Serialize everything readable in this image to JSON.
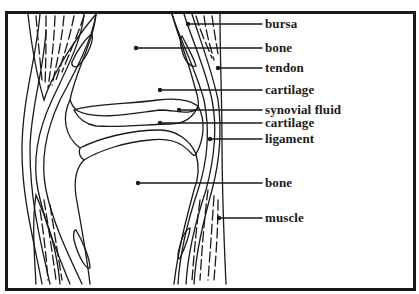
{
  "diagram": {
    "colors": {
      "stroke": "#1a1a1a",
      "background": "#ffffff"
    },
    "labels": [
      {
        "id": "bursa",
        "text": "bursa",
        "x": 265,
        "y": 18
      },
      {
        "id": "bone-upper",
        "text": "bone",
        "x": 265,
        "y": 42
      },
      {
        "id": "tendon",
        "text": "tendon",
        "x": 265,
        "y": 62
      },
      {
        "id": "cartilage-upper",
        "text": "cartilage",
        "x": 265,
        "y": 83
      },
      {
        "id": "synovial-fluid",
        "text": "synovial fluid",
        "x": 265,
        "y": 104
      },
      {
        "id": "cartilage-lower",
        "text": "cartilage",
        "x": 265,
        "y": 117
      },
      {
        "id": "ligament",
        "text": "ligament",
        "x": 265,
        "y": 133
      },
      {
        "id": "bone-lower",
        "text": "bone",
        "x": 265,
        "y": 176
      },
      {
        "id": "muscle",
        "text": "muscle",
        "x": 265,
        "y": 211
      }
    ]
  }
}
